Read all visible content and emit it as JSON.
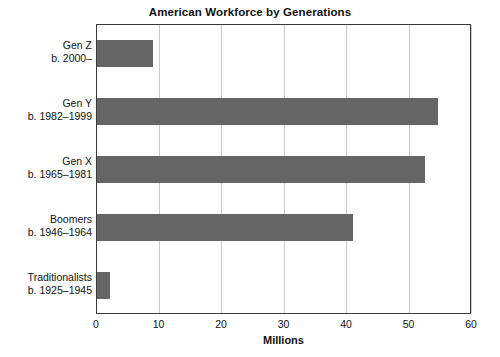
{
  "chart_data": {
    "type": "bar",
    "orientation": "horizontal",
    "title": "American Workforce by Generations",
    "xlabel": "Millions",
    "ylabel": "",
    "xlim": [
      0,
      60
    ],
    "xticks": [
      "0",
      "10",
      "20",
      "30",
      "40",
      "50",
      "60"
    ],
    "grid": true,
    "legend": null,
    "bar_color": "#656565",
    "categories": [
      {
        "line1": "Gen Z",
        "line2": "b. 2000–"
      },
      {
        "line1": "Gen Y",
        "line2": "b. 1982–1999"
      },
      {
        "line1": "Gen X",
        "line2": "b. 1965–1981"
      },
      {
        "line1": "Boomers",
        "line2": "b. 1946–1964"
      },
      {
        "line1": "Traditionalists",
        "line2": "b. 1925–1945"
      }
    ],
    "values": [
      9,
      54.5,
      52.5,
      41,
      2
    ]
  }
}
